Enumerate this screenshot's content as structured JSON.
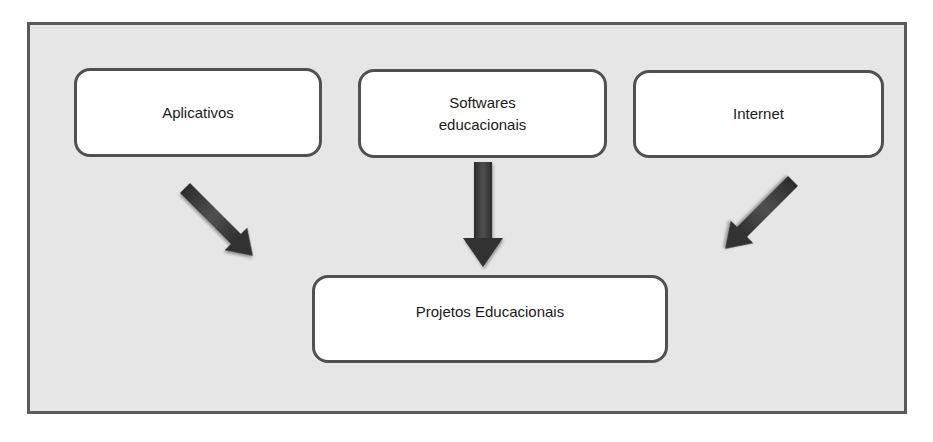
{
  "diagram": {
    "sources": [
      {
        "label": "Aplicativos"
      },
      {
        "label": "Softwares\neducacionais"
      },
      {
        "label": "Internet"
      }
    ],
    "target": {
      "label": "Projetos Educacionais"
    },
    "colors": {
      "background": "#e6e6e6",
      "frame_border": "#5a5a5a",
      "box_fill": "#ffffff",
      "box_border": "#505050",
      "arrow": "#3a3a3a"
    }
  }
}
